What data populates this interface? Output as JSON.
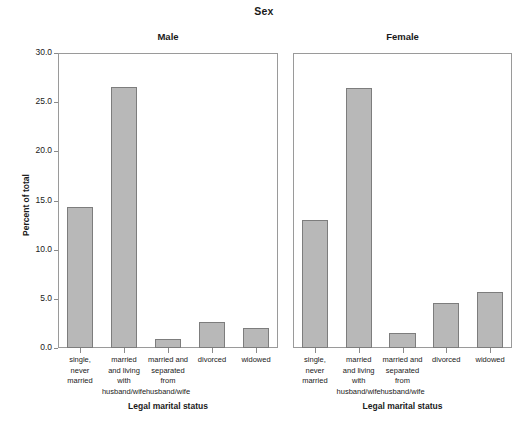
{
  "chart_data": {
    "type": "bar",
    "title": "Sex",
    "xlabel": "Legal marital status",
    "ylabel": "Percent of total",
    "ylim": [
      0,
      30
    ],
    "ytick_labels": [
      "0.0",
      "5.0",
      "10.0",
      "15.0",
      "20.0",
      "25.0",
      "30.0"
    ],
    "ytick_values": [
      0,
      5,
      10,
      15,
      20,
      25,
      30
    ],
    "grid": false,
    "legend": "none",
    "categories": [
      "single,\nnever\nmarried",
      "married\nand living\nwith\nhusband/wife",
      "married and\nseparated\nfrom\nhusband/wife",
      "divorced",
      "widowed"
    ],
    "panels": [
      {
        "label": "Male",
        "values": [
          14.3,
          26.5,
          0.9,
          2.6,
          2.0
        ]
      },
      {
        "label": "Female",
        "values": [
          13.0,
          26.4,
          1.5,
          4.6,
          5.7
        ]
      }
    ],
    "colors": {
      "bar_fill": "#b8b8b8",
      "bar_border": "#7d7d7d",
      "frame": "#9a9a9a",
      "text": "#1a1a1a",
      "background": "#ffffff"
    }
  }
}
